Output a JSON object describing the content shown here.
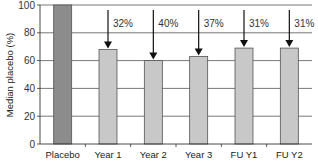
{
  "chart_data": {
    "type": "bar",
    "title": "",
    "xlabel": "",
    "ylabel": "Median placebo (%)",
    "ylim": [
      0,
      100
    ],
    "yticks": [
      0,
      20,
      40,
      60,
      80,
      100
    ],
    "grid": true,
    "categories": [
      "Placebo",
      "Year 1",
      "Year 2",
      "Year 3",
      "FU Y1",
      "FU Y2"
    ],
    "values": [
      100,
      68,
      60,
      63,
      69,
      69
    ],
    "annotations": [
      {
        "category": "Year 1",
        "text": "32%",
        "type": "down-arrow"
      },
      {
        "category": "Year 2",
        "text": "40%",
        "type": "down-arrow"
      },
      {
        "category": "Year 3",
        "text": "37%",
        "type": "down-arrow"
      },
      {
        "category": "FU Y1",
        "text": "31%",
        "type": "down-arrow"
      },
      {
        "category": "FU Y2",
        "text": "31%",
        "type": "down-arrow"
      }
    ],
    "colors": {
      "placebo": "#8c8c8c",
      "treatment": "#c8c8c8",
      "outline": "#555555",
      "grid": "#555555"
    }
  }
}
